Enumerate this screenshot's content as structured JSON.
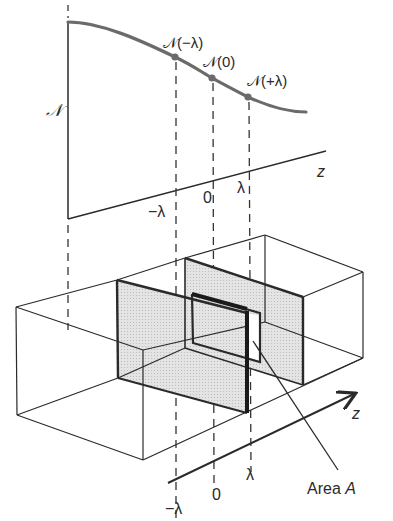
{
  "figure": {
    "top_plot": {
      "y_axis_label": "𝒩",
      "x_axis_label": "z",
      "curve_points": [
        {
          "label": "𝒩(−λ)",
          "z": "−λ"
        },
        {
          "label": "𝒩(0)",
          "z": "0"
        },
        {
          "label": "𝒩(+λ)",
          "z": "λ"
        }
      ],
      "tick_labels": [
        "−λ",
        "0",
        "λ"
      ],
      "colors": {
        "curve": "#6b6b6b",
        "axes": "#2a2a2a"
      }
    },
    "bottom_box": {
      "axis_label": "z",
      "tick_labels": [
        "−λ",
        "0",
        "λ"
      ],
      "area_label": "Area A",
      "area_label_prefix": "Area ",
      "area_label_var": "A",
      "colors": {
        "plane_fill": "#dcdcdc",
        "lines": "#2a2a2a"
      }
    }
  }
}
